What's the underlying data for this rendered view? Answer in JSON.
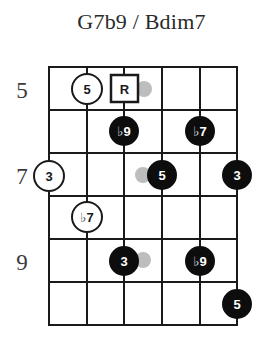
{
  "title": "G7b9 / Bdim7",
  "fretboard": {
    "strings": 6,
    "frets_shown": 6,
    "start_fret": 5,
    "colors": {
      "line": "#1a1a1a",
      "filled_dot": "#0d0d0d",
      "filled_text": "#ffffff",
      "open_dot_fill": "#ffffff",
      "open_text": "#1a1a1a",
      "ghost_dot": "#bdbdbd"
    },
    "fret_labels": [
      {
        "fret": 5,
        "text": "5"
      },
      {
        "fret": 7,
        "text": "7"
      },
      {
        "fret": 9,
        "text": "9"
      }
    ],
    "markers": [
      {
        "fret": 5,
        "string": 2,
        "label": "5",
        "style": "open-circle"
      },
      {
        "fret": 5,
        "string": 3,
        "label": "R",
        "style": "square"
      },
      {
        "fret": 6,
        "string": 3,
        "label": "♭9",
        "style": "filled"
      },
      {
        "fret": 6,
        "string": 5,
        "label": "♭7",
        "style": "filled"
      },
      {
        "fret": 7,
        "string": 1,
        "label": "3",
        "style": "open-circle"
      },
      {
        "fret": 7,
        "string": 4,
        "label": "5",
        "style": "filled"
      },
      {
        "fret": 7,
        "string": 6,
        "label": "3",
        "style": "filled"
      },
      {
        "fret": 8,
        "string": 2,
        "label": "♭7",
        "style": "open-circle"
      },
      {
        "fret": 9,
        "string": 3,
        "label": "3",
        "style": "filled"
      },
      {
        "fret": 9,
        "string": 5,
        "label": "♭9",
        "style": "filled"
      },
      {
        "fret": 10,
        "string": 6,
        "label": "5",
        "style": "filled"
      }
    ],
    "ghost_dots": [
      {
        "fret": 5,
        "between_strings": [
          3,
          4
        ]
      },
      {
        "fret": 7,
        "between_strings": [
          3,
          4
        ]
      },
      {
        "fret": 9,
        "between_strings": [
          3,
          4
        ]
      }
    ]
  }
}
